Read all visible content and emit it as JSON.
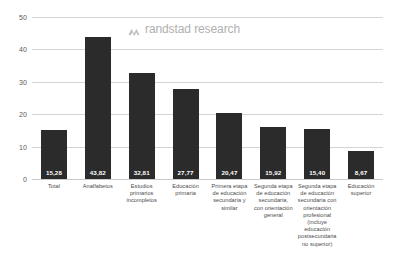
{
  "watermark": {
    "text": "randstad research",
    "mark_name": "randstad-tombstone-icon",
    "color": "#b0b0b0"
  },
  "chart_data": {
    "type": "bar",
    "title": "",
    "subtitle": "",
    "xlabel": "",
    "ylabel": "",
    "ylim": [
      0,
      50
    ],
    "yticks": [
      0,
      10,
      20,
      30,
      40,
      50
    ],
    "ytick_labels": [
      "0",
      "10",
      "20",
      "30",
      "40",
      "50"
    ],
    "grid": true,
    "legend": false,
    "bar_color": "#2c2b2b",
    "label_color": "#ffffff",
    "categories": [
      "Total",
      "Analfabetos",
      "Estudios primarios incompletos",
      "Educación primaria",
      "Primera etapa de educación secundaria y similar",
      "Segunda etapa de educación secundaria, con orientación general",
      "Segunda etapa de educación secundaria con orientación profesional (incluye educación postsecundaria no superior)",
      "Educación superior"
    ],
    "values": [
      15.28,
      43.82,
      32.81,
      27.77,
      20.47,
      15.92,
      15.4,
      8.67
    ],
    "value_labels": [
      "15,28",
      "43,82",
      "32,81",
      "27,77",
      "20,47",
      "15,92",
      "15,40",
      "8,67"
    ]
  }
}
